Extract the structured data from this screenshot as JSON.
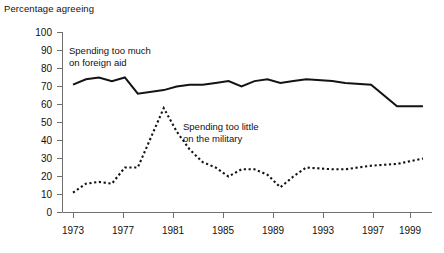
{
  "chart_data": {
    "type": "line",
    "title": "",
    "ylabel": "Percentage agreeing",
    "xlabel": "",
    "ylim": [
      0,
      100
    ],
    "xlim": [
      1973,
      2000
    ],
    "grid": false,
    "legend_position": "inline-annotations",
    "yticks": [
      "0",
      "10",
      "20",
      "30",
      "40",
      "50",
      "60",
      "70",
      "80",
      "90",
      "100"
    ],
    "ytick_values": [
      0,
      10,
      20,
      30,
      40,
      50,
      60,
      70,
      80,
      90,
      100
    ],
    "xticks": [
      "1973",
      "1977",
      "1981",
      "1985",
      "1989",
      "1993",
      "1997",
      "1999"
    ],
    "xtick_values": [
      1973,
      1977,
      1981,
      1985,
      1989,
      1993,
      1997,
      1999
    ],
    "x": [
      1973,
      1974,
      1975,
      1976,
      1977,
      1978,
      1980,
      1981,
      1982,
      1983,
      1984,
      1985,
      1986,
      1987,
      1988,
      1989,
      1990,
      1991,
      1993,
      1994,
      1996,
      1998,
      2000
    ],
    "series": [
      {
        "name": "Spending too much on foreign aid",
        "style": "solid",
        "annotation": "Spending too much\non foreign aid",
        "values": [
          71,
          74,
          75,
          73,
          75,
          66,
          68,
          70,
          71,
          71,
          72,
          73,
          70,
          73,
          74,
          72,
          73,
          74,
          73,
          72,
          71,
          59,
          59
        ]
      },
      {
        "name": "Spending too little on the military",
        "style": "dotted",
        "annotation": "Spending too little\non the military",
        "values": [
          11,
          16,
          17,
          16,
          25,
          25,
          58,
          45,
          35,
          28,
          25,
          20,
          24,
          24,
          21,
          14,
          20,
          25,
          24,
          24,
          26,
          27,
          30
        ]
      }
    ],
    "annotations": [
      {
        "text_line1": "Spending too much",
        "text_line2": "on foreign aid"
      },
      {
        "text_line1": "Spending too little",
        "text_line2": "on the military"
      }
    ],
    "colors": {
      "line": "#131313",
      "axis": "#6f6f6f",
      "text": "#111111",
      "background": "#ffffff"
    }
  }
}
